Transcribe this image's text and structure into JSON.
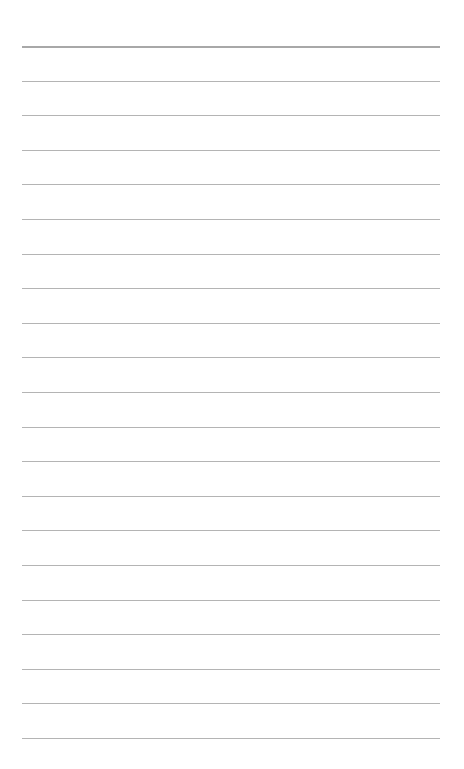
{
  "page": {
    "type": "lined-paper",
    "line_count": 21,
    "first_line_y": 46,
    "line_spacing": 34.6,
    "line_color": "#b4b4b4",
    "header_line_color": "#a8a8a8",
    "background": "#ffffff",
    "text": []
  }
}
